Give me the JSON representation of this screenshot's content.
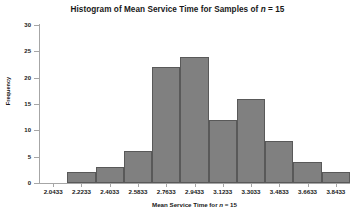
{
  "chart_data": {
    "type": "bar",
    "title": "Histogram of Mean Service Time for Samples of n = 15",
    "xlabel": "Mean Service Time for n = 15",
    "ylabel": "Frequency",
    "categories": [
      "2.0433",
      "2.2233",
      "2.4033",
      "2.5833",
      "2.7633",
      "2.9433",
      "3.1233",
      "3.3033",
      "3.4833",
      "3.6633",
      "3.8433"
    ],
    "values": [
      0,
      2,
      3,
      6,
      22,
      24,
      12,
      16,
      8,
      4,
      2
    ],
    "ylim": [
      0,
      30
    ],
    "yticks": [
      0,
      5,
      10,
      15,
      20,
      25,
      30
    ],
    "ytick_labels": [
      "0",
      "5",
      "10",
      "15",
      "20",
      "25",
      "30"
    ],
    "xtick_labels": [
      "2.0433",
      "2.2233",
      "2.4033",
      "2.5833",
      "2.7633",
      "2.9433",
      "3.1233",
      "3.3033",
      "3.4833",
      "3.6633",
      "3.8433"
    ],
    "grid": false,
    "legend": null,
    "bar_fill_color": "#808080",
    "bar_border_color": "#595959",
    "axis_color": "#a6a6a6",
    "text_color": "#181818",
    "background_color": "#ffffff"
  },
  "title_parts": {
    "before_italic": "Histogram of Mean Service Time for Samples of ",
    "italic": "n",
    "after_italic": " = 15"
  },
  "xlabel_parts": {
    "before_italic": "Mean Service Time for ",
    "italic": "n",
    "after_italic": " = 15"
  }
}
